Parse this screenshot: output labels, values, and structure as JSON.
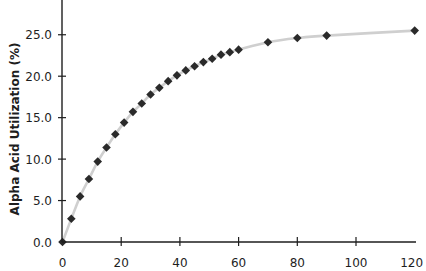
{
  "chart_data": {
    "type": "line",
    "title": "",
    "xlabel": "",
    "ylabel": "Alpha Acid Utilization (%)",
    "xlim": [
      0,
      120
    ],
    "ylim": [
      0,
      29
    ],
    "x_ticks": [
      0,
      20,
      40,
      60,
      80,
      100,
      120
    ],
    "x_tick_labels": [
      "0",
      "20",
      "40",
      "60",
      "80",
      "100",
      "120"
    ],
    "y_ticks": [
      0,
      5,
      10,
      15,
      20,
      25
    ],
    "y_tick_labels": [
      "0.0",
      "5.0",
      "10.0",
      "15.0",
      "20.0",
      "25.0"
    ],
    "grid": false,
    "legend": null,
    "series": [
      {
        "name": "Alpha Acid Utilization",
        "marker": "diamond",
        "marker_color": "#2a2a2a",
        "line_color": "#cfcfcf",
        "x": [
          0,
          3,
          6,
          9,
          12,
          15,
          18,
          21,
          24,
          27,
          30,
          33,
          36,
          39,
          42,
          45,
          48,
          51,
          54,
          57,
          60,
          70,
          80,
          90,
          120
        ],
        "values": [
          0.0,
          2.8,
          5.5,
          7.6,
          9.7,
          11.4,
          13.0,
          14.4,
          15.7,
          16.7,
          17.8,
          18.6,
          19.4,
          20.1,
          20.7,
          21.2,
          21.7,
          22.1,
          22.6,
          22.9,
          23.2,
          24.1,
          24.6,
          24.9,
          25.5
        ]
      }
    ]
  },
  "colors": {
    "axis": "#1e1e1e",
    "line": "#cfcfcf",
    "marker": "#2a2a2a",
    "background": "#ffffff"
  }
}
